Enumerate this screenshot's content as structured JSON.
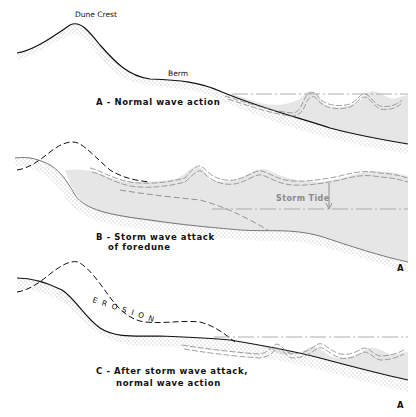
{
  "diagram": {
    "panels": [
      {
        "id": "A",
        "caption": "A - Normal wave action",
        "labels": {
          "dune_crest": "Dune Crest",
          "berm": "Berm"
        }
      },
      {
        "id": "B",
        "caption_line1": "B - Storm wave attack",
        "caption_line2": "of foredune",
        "labels": {
          "storm_tide": "Storm Tide",
          "marker": "A"
        }
      },
      {
        "id": "C",
        "caption_line1": "C - After storm wave attack,",
        "caption_line2": "normal wave action",
        "labels": {
          "erosion": "EROSION",
          "marker": "A"
        }
      }
    ],
    "colors": {
      "ground_line": "#111111",
      "water_fill": "#e6e6e6",
      "sand_dots": "#555555",
      "dashed_profile": "#111111",
      "water_line": "#999999"
    }
  }
}
